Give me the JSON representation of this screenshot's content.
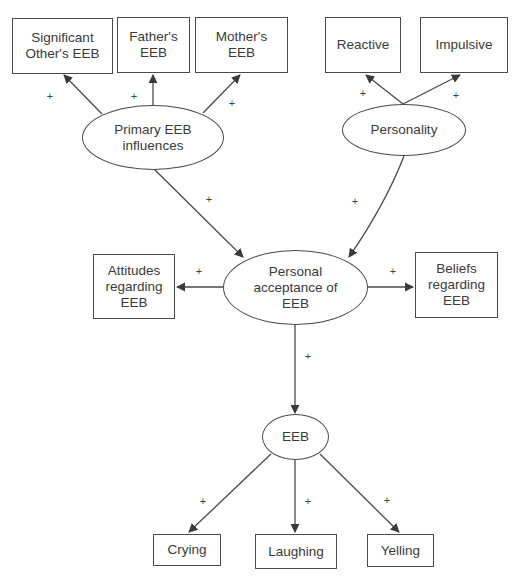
{
  "diagram": {
    "type": "path-model",
    "colors": {
      "stroke": "#4a4a4a",
      "text": "#3a3a3a",
      "background": "#ffffff"
    },
    "nodes": {
      "sig_other": {
        "label": "Significant\nOther's EEB",
        "shape": "rectangle"
      },
      "father": {
        "label": "Father's\nEEB",
        "shape": "rectangle"
      },
      "mother": {
        "label": "Mother's\nEEB",
        "shape": "rectangle"
      },
      "reactive": {
        "label": "Reactive",
        "shape": "rectangle"
      },
      "impulsive": {
        "label": "Impulsive",
        "shape": "rectangle"
      },
      "primary": {
        "label": "Primary EEB\ninfluences",
        "shape": "ellipse"
      },
      "personality": {
        "label": "Personality",
        "shape": "ellipse"
      },
      "attitudes": {
        "label": "Attitudes\nregarding\nEEB",
        "shape": "rectangle"
      },
      "acceptance": {
        "label": "Personal\nacceptance of\nEEB",
        "shape": "ellipse"
      },
      "beliefs": {
        "label": "Beliefs\nregarding\nEEB",
        "shape": "rectangle"
      },
      "eeb": {
        "label": "EEB",
        "shape": "ellipse"
      },
      "crying": {
        "label": "Crying",
        "shape": "rectangle"
      },
      "laughing": {
        "label": "Laughing",
        "shape": "rectangle"
      },
      "yelling": {
        "label": "Yelling",
        "shape": "rectangle"
      }
    },
    "edges": [
      {
        "from": "primary",
        "to": "sig_other",
        "sign": "+"
      },
      {
        "from": "primary",
        "to": "father",
        "sign": "+"
      },
      {
        "from": "primary",
        "to": "mother",
        "sign": "+"
      },
      {
        "from": "personality",
        "to": "reactive",
        "sign": "+"
      },
      {
        "from": "personality",
        "to": "impulsive",
        "sign": "+"
      },
      {
        "from": "primary",
        "to": "acceptance",
        "sign": "+"
      },
      {
        "from": "personality",
        "to": "acceptance",
        "sign": "+"
      },
      {
        "from": "acceptance",
        "to": "attitudes",
        "sign": "+"
      },
      {
        "from": "acceptance",
        "to": "beliefs",
        "sign": "+"
      },
      {
        "from": "acceptance",
        "to": "eeb",
        "sign": "+"
      },
      {
        "from": "eeb",
        "to": "crying",
        "sign": "+"
      },
      {
        "from": "eeb",
        "to": "laughing",
        "sign": "+"
      },
      {
        "from": "eeb",
        "to": "yelling",
        "sign": "+"
      }
    ]
  }
}
